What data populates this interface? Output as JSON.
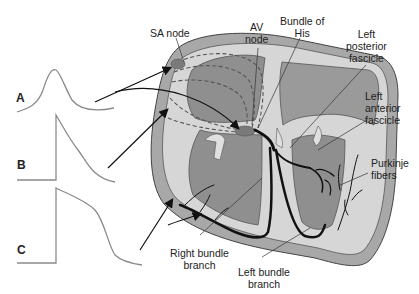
{
  "trace_labels": {
    "a": "A",
    "b": "B",
    "c": "C"
  },
  "labels": {
    "sa_node": "SA node",
    "av_node_line1": "AV",
    "av_node_line2": "node",
    "bundle_his_line1": "Bundle of",
    "bundle_his_line2": "His",
    "left_posterior_line1": "Left",
    "left_posterior_line2": "posterior",
    "left_posterior_line3": "fascicle",
    "left_anterior_line1": "Left",
    "left_anterior_line2": "anterior",
    "left_anterior_line3": "fascicle",
    "purkinje_line1": "Purkinje",
    "purkinje_line2": "fibers",
    "right_bundle_line1": "Right bundle",
    "right_bundle_line2": "branch",
    "left_bundle_line1": "Left bundle",
    "left_bundle_line2": "branch"
  },
  "colors": {
    "outer_wall": "#a8a8a8",
    "inner_chamber": "#8f8f8f",
    "light_tissue": "#d9d9d9",
    "trace": "#8a8a8a",
    "conduction": "#111111",
    "text": "#222222"
  }
}
